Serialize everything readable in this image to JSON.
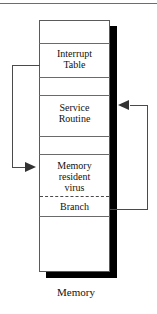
{
  "figure": {
    "caption": "Memory",
    "column": {
      "segments": [
        {
          "id": "free-top",
          "label": ""
        },
        {
          "id": "interrupt-table",
          "label": "Interrupt\nTable"
        },
        {
          "id": "free-mid-1",
          "label": ""
        },
        {
          "id": "service-routine",
          "label": "Service\nRoutine"
        },
        {
          "id": "free-mid-2",
          "label": ""
        },
        {
          "id": "virus-body",
          "label": "Memory\nresident\nvirus"
        },
        {
          "id": "branch",
          "label": "Branch"
        },
        {
          "id": "free-bottom",
          "label": ""
        }
      ]
    },
    "labels": {
      "interrupt_table_line1": "Interrupt",
      "interrupt_table_line2": "Table",
      "service_routine_line1": "Service",
      "service_routine_line2": "Routine",
      "virus_line1": "Memory",
      "virus_line2": "resident",
      "virus_line3": "virus",
      "branch": "Branch"
    },
    "connectors": [
      {
        "id": "interrupt-vector-to-virus",
        "from": "interrupt-table",
        "to": "virus-body",
        "side": "left",
        "arrow": "right"
      },
      {
        "id": "branch-to-service-routine",
        "from": "branch",
        "to": "service-routine",
        "side": "right",
        "arrow": "left"
      }
    ],
    "colors": {
      "stroke": "#4a4a4a",
      "box_border": "#5a5a5a",
      "shadow": "#000000",
      "arrow_fill": "#333333",
      "background": "#ffffff",
      "text": "#111111"
    }
  }
}
